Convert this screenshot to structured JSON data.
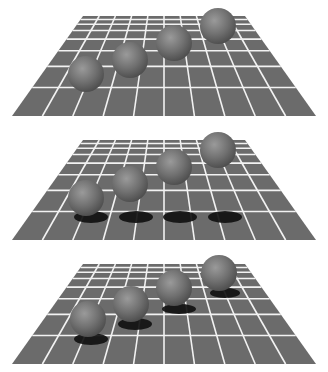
{
  "figure": {
    "colors": {
      "background": "#ffffff",
      "grid_tile": "#6b6b6b",
      "grid_line": "#f2f2f2",
      "sphere_light": "#9a9a9a",
      "sphere_mid": "#707070",
      "sphere_dark": "#4a4a4a",
      "shadow": "#111111"
    },
    "grid": {
      "columns": 10,
      "rows": 8,
      "top_left_x": 83,
      "top_right_x": 245,
      "top_y": 16,
      "bottom_left_x": 12,
      "bottom_right_x": 316,
      "bottom_y": 116
    },
    "panels": [
      {
        "name": "no-shadows",
        "offset_y": 0,
        "spheres": [
          {
            "cx": 86,
            "cy": 74,
            "r": 18
          },
          {
            "cx": 130,
            "cy": 60,
            "r": 18
          },
          {
            "cx": 174,
            "cy": 43,
            "r": 18
          },
          {
            "cx": 218,
            "cy": 26,
            "r": 18
          }
        ],
        "shadows": []
      },
      {
        "name": "shadows-in-row",
        "offset_y": 124,
        "spheres": [
          {
            "cx": 86,
            "cy": 74,
            "r": 18
          },
          {
            "cx": 130,
            "cy": 60,
            "r": 18
          },
          {
            "cx": 174,
            "cy": 43,
            "r": 18
          },
          {
            "cx": 218,
            "cy": 26,
            "r": 18
          }
        ],
        "shadows": [
          {
            "cx": 91,
            "cy": 93,
            "rx": 17,
            "ry": 6
          },
          {
            "cx": 136,
            "cy": 93,
            "rx": 17,
            "ry": 6
          },
          {
            "cx": 180,
            "cy": 93,
            "rx": 17,
            "ry": 6
          },
          {
            "cx": 225,
            "cy": 93,
            "rx": 17,
            "ry": 6
          }
        ]
      },
      {
        "name": "shadows-under-spheres",
        "offset_y": 248,
        "spheres": [
          {
            "cx": 88,
            "cy": 71,
            "r": 18
          },
          {
            "cx": 131,
            "cy": 56,
            "r": 18
          },
          {
            "cx": 174,
            "cy": 40,
            "r": 18
          },
          {
            "cx": 219,
            "cy": 25,
            "r": 18
          }
        ],
        "shadows": [
          {
            "cx": 91,
            "cy": 91,
            "rx": 17,
            "ry": 6
          },
          {
            "cx": 135,
            "cy": 76,
            "rx": 17,
            "ry": 6
          },
          {
            "cx": 179,
            "cy": 61,
            "rx": 17,
            "ry": 5
          },
          {
            "cx": 225,
            "cy": 45,
            "rx": 15,
            "ry": 5
          }
        ]
      }
    ]
  }
}
